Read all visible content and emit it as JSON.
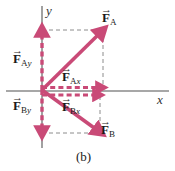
{
  "figure": {
    "caption": "(b)",
    "axes": {
      "x_label": "x",
      "y_label": "y"
    },
    "colors": {
      "vector": "#c94a77",
      "vector_dark": "#bd3f6d",
      "axis": "#808080",
      "dashed_guide": "#8c8c8c",
      "text": "#1a1a1a",
      "background": "#ffffff"
    },
    "vectors": [
      {
        "name": "F_A",
        "label_base": "F",
        "label_sub": "A",
        "hat": "→",
        "style": "solid",
        "description": "resultant force A pointing up and to the right",
        "from": [
          42,
          90
        ],
        "to": [
          103,
          30
        ]
      },
      {
        "name": "F_Ay",
        "label_base": "F",
        "label_sub": "Ay",
        "hat": "→",
        "style": "dashed",
        "description": "y component of force A pointing up along y axis",
        "from": [
          42,
          90
        ],
        "to": [
          42,
          30
        ]
      },
      {
        "name": "F_Ax",
        "label_base": "F",
        "label_sub": "Ax",
        "hat": "→",
        "style": "dashed",
        "description": "x component of force A pointing right",
        "from": [
          42,
          88
        ],
        "to": [
          103,
          88
        ]
      },
      {
        "name": "F_B",
        "label_base": "F",
        "label_sub": "B",
        "hat": "→",
        "style": "solid",
        "description": "resultant force B pointing down and to the right",
        "from": [
          42,
          90
        ],
        "to": [
          100,
          133
        ]
      },
      {
        "name": "F_By",
        "label_base": "F",
        "label_sub": "By",
        "hat": "→",
        "style": "dashed",
        "description": "y component of force B pointing down along y axis",
        "from": [
          42,
          90
        ],
        "to": [
          42,
          133
        ]
      },
      {
        "name": "F_Bx",
        "label_base": "F",
        "label_sub": "Bx",
        "hat": "→",
        "style": "dashed",
        "description": "x component of force B pointing right",
        "from": [
          42,
          95
        ],
        "to": [
          100,
          95
        ]
      }
    ],
    "labels": {
      "fa": {
        "base": "F",
        "sub": "A",
        "hat": "→"
      },
      "fay": {
        "base": "F",
        "sub": "A",
        "sub_it": "y",
        "hat": "→"
      },
      "fax": {
        "base": "F",
        "sub": "A",
        "sub_it": "x",
        "hat": "→"
      },
      "fb": {
        "base": "F",
        "sub": "B",
        "hat": "→"
      },
      "fby": {
        "base": "F",
        "sub": "B",
        "sub_it": "y",
        "hat": "→"
      },
      "fbx": {
        "base": "F",
        "sub": "B",
        "sub_it": "x",
        "hat": "→"
      }
    }
  }
}
